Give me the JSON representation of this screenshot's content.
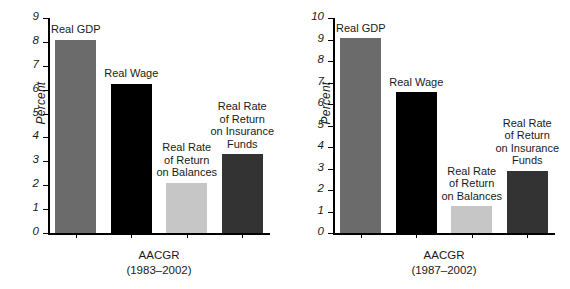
{
  "chart_data": [
    {
      "type": "bar",
      "panel": "left",
      "title": "",
      "xlabel": "AACGR",
      "xlabel_line2": "(1983–2002)",
      "ylabel": "Percent",
      "ylim": [
        0,
        9
      ],
      "yticks": [
        "0",
        "1",
        "2",
        "3",
        "4",
        "5",
        "6",
        "7",
        "8",
        "9"
      ],
      "grid": false,
      "legend": "none",
      "categories": [
        "Real GDP",
        "Real Wage",
        "Real Rate of Return on Balances",
        "Real Rate of Return on Insurance Funds"
      ],
      "values": [
        8.1,
        6.25,
        2.1,
        3.3
      ],
      "bars": [
        {
          "label_lines": [
            "Real GDP"
          ],
          "value": 8.1,
          "color": "#6b6b6b"
        },
        {
          "label_lines": [
            "Real Wage"
          ],
          "value": 6.25,
          "color": "#000000"
        },
        {
          "label_lines": [
            "Real Rate",
            "of Return",
            "on Balances"
          ],
          "value": 2.1,
          "color": "#c6c6c6"
        },
        {
          "label_lines": [
            "Real Rate",
            "of Return",
            "on Insurance",
            "Funds"
          ],
          "value": 3.3,
          "color": "#333333"
        }
      ]
    },
    {
      "type": "bar",
      "panel": "right",
      "title": "",
      "xlabel": "AACGR",
      "xlabel_line2": "(1987–2002)",
      "ylabel": "Percent",
      "ylim": [
        0,
        10
      ],
      "yticks": [
        "0",
        "1",
        "2",
        "3",
        "4",
        "5",
        "6",
        "7",
        "8",
        "9",
        "10"
      ],
      "grid": false,
      "legend": "none",
      "categories": [
        "Real GDP",
        "Real Wage",
        "Real Rate of Return on Balances",
        "Real Rate of Return on Insurance Funds"
      ],
      "values": [
        9.05,
        6.55,
        1.25,
        2.9
      ],
      "bars": [
        {
          "label_lines": [
            "Real GDP"
          ],
          "value": 9.05,
          "color": "#6b6b6b"
        },
        {
          "label_lines": [
            "Real Wage"
          ],
          "value": 6.55,
          "color": "#000000"
        },
        {
          "label_lines": [
            "Real Rate",
            "of Return",
            "on Balances"
          ],
          "value": 1.25,
          "color": "#c6c6c6"
        },
        {
          "label_lines": [
            "Real Rate",
            "of Return",
            "on Insurance",
            "Funds"
          ],
          "value": 2.9,
          "color": "#333333"
        }
      ]
    }
  ]
}
